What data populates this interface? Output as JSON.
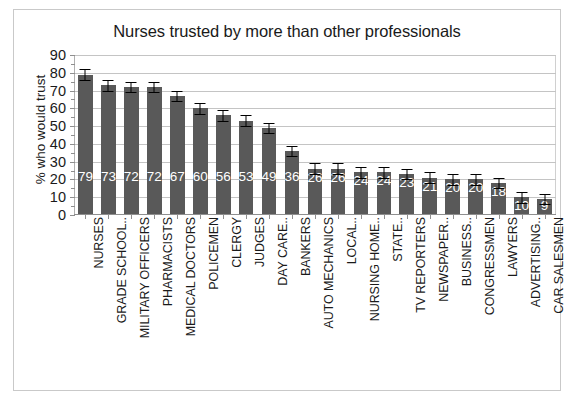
{
  "chart_data": {
    "type": "bar",
    "title": "Nurses trusted by more than other professionals",
    "xlabel": "",
    "ylabel": "% who would trust",
    "ylim": [
      0,
      90
    ],
    "ytick_step": 10,
    "yticks": [
      "90",
      "80",
      "70",
      "60",
      "50",
      "40",
      "30",
      "20",
      "10",
      "0"
    ],
    "grid": true,
    "legend": "none",
    "bar_color": "#595959",
    "value_label_color": "#ffffff",
    "error_bar_color": "#000000",
    "categories": [
      "NURSES",
      "GRADE SCHOOL..",
      "MILITARY OFFICERS",
      "PHARMACISTS",
      "MEDICAL DOCTORS",
      "POLICEMEN",
      "CLERGY",
      "JUDGES",
      "DAY CARE..",
      "BANKERS",
      "AUTO MECHANICS",
      "LOCAL..",
      "NURSING HOME..",
      "STATE..",
      "TV REPORTERS",
      "NEWSPAPER..",
      "BUSINESS..",
      "CONGRESSMEN",
      "LAWYERS",
      "ADVERTISING..",
      "CAR SALESMEN"
    ],
    "values": [
      79,
      73,
      72,
      72,
      67,
      60,
      56,
      53,
      49,
      36,
      26,
      26,
      24,
      24,
      23,
      21,
      20,
      20,
      18,
      10,
      9
    ],
    "errors": [
      3,
      3,
      3,
      3,
      3,
      3,
      3,
      3,
      3,
      3,
      3,
      3,
      3,
      3,
      3,
      3,
      3,
      3,
      3,
      3,
      3
    ]
  }
}
